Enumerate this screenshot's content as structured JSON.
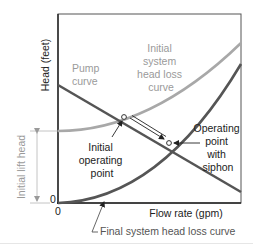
{
  "figure": {
    "axes": {
      "y_label": "Head (feet)",
      "x_label": "Flow rate (gpm)",
      "x_origin_tick": "0",
      "y_origin_tick": "0"
    },
    "curves": {
      "pump": {
        "label_lines": [
          "Pump",
          "curve"
        ],
        "color": "#555555"
      },
      "initial_system": {
        "label_lines": [
          "Initial",
          "system",
          "head loss",
          "curve"
        ],
        "color": "#a8a8a8"
      },
      "final_system": {
        "label": "Final system head loss curve",
        "color": "#555555"
      }
    },
    "annotations": {
      "initial_operating_point": [
        "Initial",
        "operating",
        "point"
      ],
      "operating_point_with_siphon": [
        "Operating",
        "point",
        "with",
        "siphon"
      ],
      "initial_lift_head": "Initial lift head"
    },
    "colors": {
      "frame": "#555555",
      "axis": "#222222",
      "text_dark": "#222222",
      "text_gray": "#9a9a9a"
    }
  }
}
